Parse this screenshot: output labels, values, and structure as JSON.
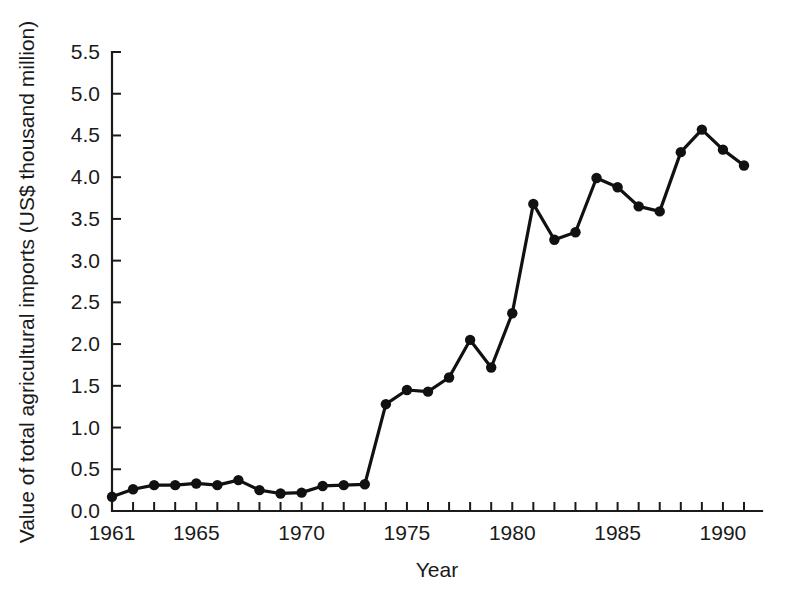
{
  "chart_data": {
    "type": "line",
    "title": "",
    "xlabel": "Year",
    "ylabel": "Value of total agricultural imports  (US$ thousand million)",
    "xlim": [
      1961,
      1991
    ],
    "ylim": [
      0.0,
      5.5
    ],
    "grid": false,
    "legend": null,
    "x_ticks_major": [
      1961,
      1965,
      1970,
      1975,
      1980,
      1985,
      1990
    ],
    "x_tick_labels": [
      "1961",
      "1965",
      "1970",
      "1975",
      "1980",
      "1985",
      "1990"
    ],
    "y_ticks": [
      0.0,
      0.5,
      1.0,
      1.5,
      2.0,
      2.5,
      3.0,
      3.5,
      4.0,
      4.5,
      5.0,
      5.5
    ],
    "y_tick_labels": [
      "0.0",
      "0.5",
      "1.0",
      "1.5",
      "2.0",
      "2.5",
      "3.0",
      "3.5",
      "4.0",
      "4.5",
      "5.0",
      "5.5"
    ],
    "x": [
      1961,
      1962,
      1963,
      1964,
      1965,
      1966,
      1967,
      1968,
      1969,
      1970,
      1971,
      1972,
      1973,
      1974,
      1975,
      1976,
      1977,
      1978,
      1979,
      1980,
      1981,
      1982,
      1983,
      1984,
      1985,
      1986,
      1987,
      1988,
      1989,
      1990
    ],
    "values": [
      0.17,
      0.26,
      0.31,
      0.31,
      0.33,
      0.31,
      0.37,
      0.25,
      0.21,
      0.22,
      0.3,
      0.31,
      0.32,
      1.28,
      1.45,
      1.43,
      1.6,
      2.05,
      1.72,
      2.37,
      3.68,
      3.25,
      3.34,
      3.99,
      3.88,
      3.65,
      3.59,
      4.3,
      4.57,
      4.33
    ],
    "series_name": "Value of total agricultural imports",
    "marker": "filled-circle",
    "line_color": "#111111",
    "marker_color": "#111111",
    "background_color": "#ffffff"
  },
  "extra_point": {
    "x": 1991,
    "value": 4.14
  }
}
